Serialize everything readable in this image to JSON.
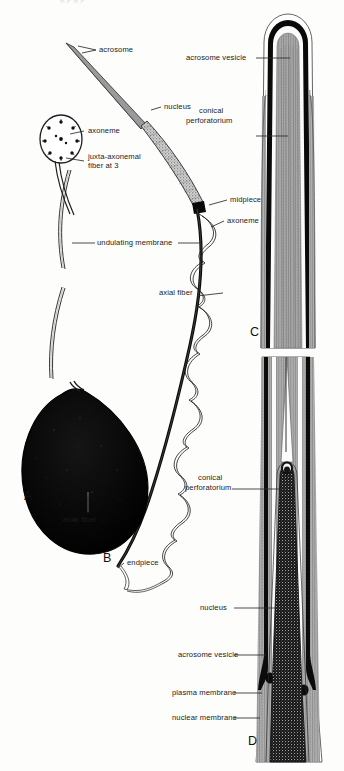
{
  "figure": {
    "background_color": "#fdfdfc",
    "ink_color": "#1b1b1b",
    "top_cut_text": "g       p g  p"
  },
  "panels": [
    {
      "id": "A",
      "label": "A",
      "name": "panel-a-whole-sperm-head-and-body",
      "description": "Whole sperm: acrosome, nucleus, midpiece, undulating membrane, axial fiber, large dark body"
    },
    {
      "id": "B",
      "label": "B",
      "name": "panel-b-tail-endpiece",
      "description": "Tail with axoneme coiled around axial fiber ending in endpiece"
    },
    {
      "id": "C",
      "label": "C",
      "name": "panel-c-longitudinal-section-apex",
      "description": "Longitudinal section through rounded acrosomal apex showing acrosome vesicle and conical perforatorium"
    },
    {
      "id": "D",
      "label": "D",
      "name": "panel-d-longitudinal-section-nucleus",
      "description": "Longitudinal section lower down showing nucleus, acrosome vesicle, plasma membrane and nuclear membrane"
    }
  ],
  "labels": {
    "acrosome": "acrosome",
    "nucleus": "nucleus",
    "axoneme": "axoneme",
    "juxta_axonemal": "juxta-axonemal fiber at 3",
    "undulating_membrane": "undulating membrane",
    "midpiece": "midpiece",
    "axoneme_2": "axoneme",
    "axial_fiber_tail": "axial fiber",
    "axial_fiber_body": "axial fiber",
    "endpiece": "endpiece",
    "acrosome_vesicle_c": "acrosome vesicle",
    "conical_perforatorium_c_line1": "conical",
    "conical_perforatorium_c_line2": "perforatorium",
    "conical_perforatorium_d_line1": "conical",
    "conical_perforatorium_d_line2": "perforatorium",
    "nucleus_d": "nucleus",
    "acrosome_vesicle_d": "acrosome vesicle",
    "plasma_membrane_d": "plasma membrane",
    "nuclear_membrane_d": "nuclear membrane"
  }
}
